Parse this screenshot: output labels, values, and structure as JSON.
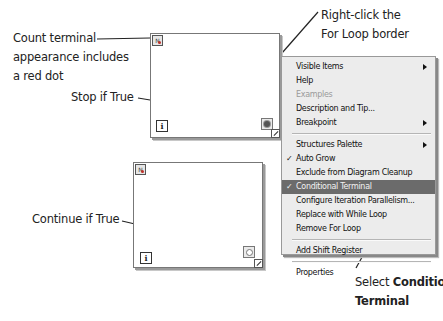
{
  "annotations": {
    "count_terminal": [
      "Count terminal",
      "appearance includes",
      "a red dot"
    ],
    "stop_if_true": "Stop if True",
    "right_click": [
      "Right-click the",
      "For Loop border"
    ],
    "continue_if_true": "Continue if True",
    "select_prefix": "Select ",
    "select_bold_1": "Conditional",
    "select_bold_2": "Terminal"
  },
  "loops": {
    "top": {
      "count_label": "N",
      "iteration_label": "i",
      "terminal": "stop-if-true"
    },
    "bottom": {
      "count_label": "N",
      "iteration_label": "i",
      "terminal": "continue-if-true"
    }
  },
  "context_menu": {
    "items": [
      {
        "label": "Visible Items",
        "submenu": true
      },
      {
        "label": "Help"
      },
      {
        "label": "Examples",
        "disabled": true
      },
      {
        "label": "Description and Tip..."
      },
      {
        "label": "Breakpoint",
        "submenu": true
      },
      {
        "separator": true
      },
      {
        "label": "Structures Palette",
        "submenu": true
      },
      {
        "label": "Auto Grow",
        "checked": true
      },
      {
        "label": "Exclude from Diagram Cleanup"
      },
      {
        "label": "Conditional Terminal",
        "checked": true,
        "selected": true
      },
      {
        "label": "Configure Iteration Parallelism..."
      },
      {
        "label": "Replace with While Loop"
      },
      {
        "label": "Remove For Loop"
      },
      {
        "separator": true
      },
      {
        "label": "Add Shift Register"
      },
      {
        "separator": true
      },
      {
        "label": "Properties"
      }
    ],
    "check_glyph": "✓"
  },
  "colors": {
    "red_dot": "#c0302a",
    "menu_bg": "#ececec",
    "menu_selected": "#6b6b6b"
  }
}
